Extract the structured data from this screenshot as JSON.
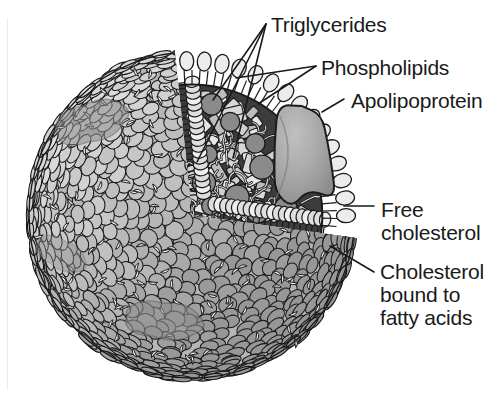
{
  "figure": {
    "background_color": "#ffffff"
  },
  "labels": [
    {
      "name": "triglycerides",
      "text": "Triglycerides",
      "x": 271,
      "y": 13,
      "lines": 1
    },
    {
      "name": "phospholipids",
      "text": "Phospholipids",
      "x": 321,
      "y": 56,
      "lines": 1
    },
    {
      "name": "apolipoprotein",
      "text": "Apolipoprotein",
      "x": 351,
      "y": 89,
      "lines": 1
    },
    {
      "name": "free-cholesterol",
      "text": "Free\ncholesterol",
      "x": 381,
      "y": 198,
      "lines": 2
    },
    {
      "name": "cholesterol-bound",
      "text": "Cholesterol\nbound to\nfatty acids",
      "x": 380,
      "y": 260,
      "lines": 3
    }
  ],
  "structure": {
    "particle": {
      "center_x": 192,
      "center_y": 215,
      "radius": 163,
      "shell_label": "phospholipid-monolayer-shell"
    },
    "cutaway": {
      "label": "wedge-cutaway",
      "start_angle_deg": -96,
      "end_angle_deg": 8
    },
    "apolipoprotein_blob": {
      "label": "apolipoprotein-body",
      "x": 300,
      "y": 155
    },
    "core": {
      "label": "hydrophobic-core",
      "fill": "#3c3c3c"
    }
  },
  "colors": {
    "outline": "#1a1a1a",
    "head_light": "#d9d9d9",
    "head_mid": "#b0b0b0",
    "head_dark": "#8e8e8e",
    "core_dark": "#3c3c3c",
    "cholesterol": "#8a8a8a",
    "triglyceride": "#d8d8d8",
    "apolipoprotein": "#a2a2a2",
    "text": "#1a1a1a",
    "background": "#ffffff"
  },
  "leaders": {
    "triglycerides": "3-line-fan-to-core",
    "phospholipids": "2-line-fan-to-surface-heads",
    "apolipoprotein": "short-horizontal-dash",
    "free_cholesterol": "horizontal-line-to-surface",
    "cholesterol_bound": "diagonal-line-to-surface"
  }
}
